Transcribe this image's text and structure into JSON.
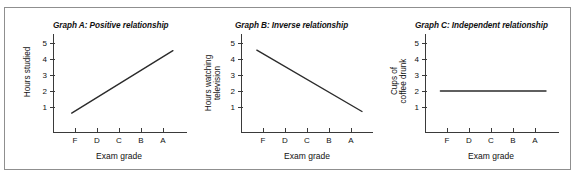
{
  "figure": {
    "border_color": "#8f8f8f",
    "background": "#ffffff",
    "line_color": "#2b2b2b",
    "axis_color": "#3a3a3a"
  },
  "chart_data": [
    {
      "type": "line",
      "title": "Graph A: Positive relationship",
      "xlabel": "Exam grade",
      "ylabel": "Hours studied",
      "ylabel_lines": [
        "Hours studied"
      ],
      "categories": [
        "F",
        "D",
        "C",
        "B",
        "A"
      ],
      "yticks": [
        1,
        2,
        3,
        4,
        5
      ],
      "ylim": [
        0,
        5.6
      ],
      "grid": false,
      "legend": "none",
      "x": [
        0.85,
        5.45
      ],
      "values": [
        0.62,
        4.52
      ],
      "series": [
        {
          "name": "Hours studied",
          "x": [
            0.85,
            5.45
          ],
          "values": [
            0.62,
            4.52
          ]
        }
      ]
    },
    {
      "type": "line",
      "title": "Graph B: Inverse relationship",
      "xlabel": "Exam grade",
      "ylabel": "Hours watching television",
      "ylabel_lines": [
        "Hours watching",
        "television"
      ],
      "categories": [
        "F",
        "D",
        "C",
        "B",
        "A"
      ],
      "yticks": [
        1,
        2,
        3,
        4,
        5
      ],
      "ylim": [
        0,
        5.6
      ],
      "grid": false,
      "legend": "none",
      "x": [
        0.72,
        5.5
      ],
      "values": [
        4.55,
        0.72
      ],
      "series": [
        {
          "name": "Hours watching television",
          "x": [
            0.72,
            5.5
          ],
          "values": [
            4.55,
            0.72
          ]
        }
      ]
    },
    {
      "type": "line",
      "title": "Graph C: Independent relationship",
      "xlabel": "Exam grade",
      "ylabel": "Cups of coffee drunk",
      "ylabel_lines": [
        "Cups of",
        "coffee drunk"
      ],
      "categories": [
        "F",
        "D",
        "C",
        "B",
        "A"
      ],
      "yticks": [
        1,
        2,
        3,
        4,
        5
      ],
      "ylim": [
        0,
        5.6
      ],
      "grid": false,
      "legend": "none",
      "x": [
        0.7,
        5.5
      ],
      "values": [
        2.0,
        2.0
      ],
      "series": [
        {
          "name": "Cups of coffee drunk",
          "x": [
            0.7,
            5.5
          ],
          "values": [
            2.0,
            2.0
          ]
        }
      ]
    }
  ]
}
